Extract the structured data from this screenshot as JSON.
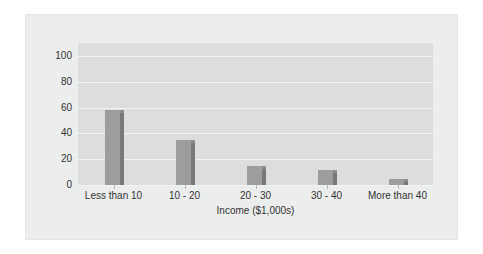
{
  "chart_data": {
    "type": "bar",
    "title": "",
    "subtitle": "",
    "xlabel": "Income ($1,000s)",
    "ylabel": "",
    "categories": [
      "Less than 10",
      "10 - 20",
      "20 - 30",
      "30 - 40",
      "More than 40"
    ],
    "values": [
      58,
      35,
      15,
      12,
      5
    ],
    "series": [
      {
        "name": "",
        "values": [
          58,
          35,
          15,
          12,
          5
        ]
      }
    ],
    "ylim": [
      0,
      110
    ],
    "y_ticks": [
      0,
      20,
      40,
      60,
      80,
      100
    ],
    "y_tick_labels": [
      "0",
      "20",
      "40",
      "60",
      "80",
      "100"
    ],
    "grid": "horizontal",
    "legend": "none",
    "annotations": [],
    "colors": {
      "bar_face": "#9c9d9d",
      "bar_side": "#76787a",
      "plot_background": "#dcdddd",
      "frame_background": "#eceded",
      "gridline": "#f2f3f3",
      "text": "#333333",
      "page_background": "#ffffff"
    }
  }
}
